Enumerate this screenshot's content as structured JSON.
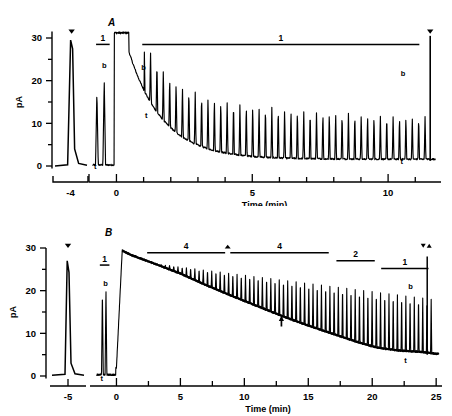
{
  "figure": {
    "type": "electrophysiology-recording",
    "panels": [
      "A",
      "B"
    ]
  },
  "panel_a": {
    "letter": "A",
    "yaxis": {
      "label": "pA",
      "ticks": [
        0,
        10,
        20,
        30
      ],
      "minor_ticks": [
        5,
        15,
        25
      ],
      "range": [
        -2,
        33
      ]
    },
    "xaxis": {
      "label": "Time (min)",
      "ticks": [
        0,
        5,
        10
      ],
      "minor_ticks": [
        1,
        2,
        3,
        4,
        6,
        7,
        8,
        9,
        11
      ],
      "range": [
        -0.9,
        11.8
      ],
      "break_segment": {
        "tick_label": "-4",
        "range": [
          -4.6,
          -3.4
        ]
      }
    },
    "bars": [
      {
        "label": "1",
        "x_start": -0.75,
        "x_end": -0.25,
        "y": 28.5
      },
      {
        "label": "1",
        "x_start": 0.95,
        "x_end": 11.15,
        "y": 28.5
      }
    ],
    "markers": [
      {
        "label": "b",
        "type": "text",
        "x": -0.45,
        "y": 23.0
      },
      {
        "label": "t",
        "type": "text",
        "x": -0.78,
        "y": -0.8
      },
      {
        "label": "b",
        "type": "text",
        "x": 1.0,
        "y": 22.5
      },
      {
        "label": "t",
        "type": "text",
        "x": 1.1,
        "y": 11.2
      },
      {
        "label": "b",
        "type": "text",
        "x": 10.55,
        "y": 21.0
      },
      {
        "label": "t",
        "type": "text",
        "x": 10.5,
        "y": 0.4
      },
      {
        "label": "triangle-down",
        "type": "glyph",
        "x": -3.95,
        "y": 32.0
      },
      {
        "label": "triangle-down",
        "type": "glyph",
        "x": 11.55,
        "y": 32.0
      }
    ],
    "chart_data": {
      "type": "line",
      "title": "A",
      "xlabel": "Time (min)",
      "ylabel": "pA",
      "xlim": [
        -0.9,
        11.8
      ],
      "ylim": [
        -2,
        33
      ],
      "description": "Whole-cell current trace: baseline spikes before 0, a large sustained plateau at ~31 pA from 0 to 0.45 min, then a decaying envelope with regular evoked transient spikes.",
      "baseline_spikes": [
        {
          "x": -3.95,
          "amplitude": 29.5
        },
        {
          "x": -0.72,
          "amplitude": 17.5
        },
        {
          "x": -0.45,
          "amplitude": 20.3
        }
      ],
      "plateau": {
        "x_start": -0.08,
        "x_end": 0.46,
        "amplitude": 31.2
      },
      "decay": {
        "x_start": 0.5,
        "x_end": 11.6,
        "start_value": 26.0,
        "tau": 1.25,
        "asymptote": 1.6
      },
      "spike_train": {
        "x_start": 1.02,
        "interval": 0.235,
        "count": 45,
        "peak_start": 22.0,
        "peak_tau": 3.6,
        "peak_floor": 10.5
      },
      "final_spike": {
        "x": 11.55,
        "amplitude": 30.5
      }
    }
  },
  "panel_b": {
    "letter": "B",
    "yaxis": {
      "label": "pA",
      "ticks": [
        0,
        10,
        20,
        30
      ],
      "minor_ticks": [
        5,
        15,
        25
      ],
      "range": [
        -2,
        32
      ]
    },
    "xaxis": {
      "label": "Time (min)",
      "ticks": [
        0,
        5,
        10,
        15,
        20,
        25
      ],
      "minor_ticks": [
        2.5,
        7.5,
        12.5,
        17.5,
        22.5
      ],
      "range": [
        -1.6,
        25.3
      ],
      "break_segment": {
        "tick_label": "-5",
        "range": [
          -5.8,
          -4.2
        ]
      }
    },
    "bars": [
      {
        "label": "1",
        "x_start": -1.3,
        "x_end": -0.55,
        "y": 26.0
      },
      {
        "label": "4",
        "x_start": 2.4,
        "x_end": 8.5,
        "y": 28.9
      },
      {
        "label": "4",
        "x_start": 8.9,
        "x_end": 16.6,
        "y": 28.9
      },
      {
        "label": "2",
        "x_start": 17.2,
        "x_end": 20.2,
        "y": 27.0
      },
      {
        "label": "1",
        "x_start": 20.7,
        "x_end": 24.4,
        "y": 25.2
      }
    ],
    "markers": [
      {
        "label": "b",
        "type": "text",
        "x": -0.85,
        "y": 21.0
      },
      {
        "label": "t",
        "type": "text",
        "x": -1.15,
        "y": -1.2
      },
      {
        "label": "b",
        "type": "text",
        "x": 23.0,
        "y": 20.5
      },
      {
        "label": "t",
        "type": "text",
        "x": 22.6,
        "y": 3.0
      },
      {
        "label": "arrow-up",
        "type": "glyph",
        "x": 12.9,
        "y": 11.6
      },
      {
        "label": "triangle-down",
        "type": "glyph",
        "x": -5.0,
        "y": 31.0
      },
      {
        "label": "triangle-pair",
        "type": "glyph",
        "x": 24.3,
        "y": 31.0
      },
      {
        "label": "triangle-up-small",
        "type": "glyph",
        "x": 8.7,
        "y": 29.9
      }
    ],
    "chart_data": {
      "type": "line",
      "title": "B",
      "xlabel": "Time (min)",
      "ylabel": "pA",
      "xlim": [
        -1.6,
        25.3
      ],
      "ylim": [
        -2,
        32
      ],
      "description": "Whole-cell current trace: baseline spikes before 0, peak ~29.5 pA just after 0, then a slow near-linear run-down to ~5 pA by 25 min, with a dense train of evoked transient spikes riding on the envelope.",
      "baseline_spikes": [
        {
          "x": -5.0,
          "amplitude": 27.0
        },
        {
          "x": -1.1,
          "amplitude": 19.5
        },
        {
          "x": -0.82,
          "amplitude": 20.3
        }
      ],
      "envelope": [
        {
          "x": 0.0,
          "y": 2.0
        },
        {
          "x": 0.45,
          "y": 29.4
        },
        {
          "x": 1.2,
          "y": 28.3
        },
        {
          "x": 3.0,
          "y": 26.3
        },
        {
          "x": 5.0,
          "y": 24.0
        },
        {
          "x": 7.0,
          "y": 21.3
        },
        {
          "x": 9.0,
          "y": 18.8
        },
        {
          "x": 11.0,
          "y": 16.4
        },
        {
          "x": 13.0,
          "y": 14.0
        },
        {
          "x": 15.0,
          "y": 11.8
        },
        {
          "x": 17.0,
          "y": 9.8
        },
        {
          "x": 19.0,
          "y": 7.8
        },
        {
          "x": 20.5,
          "y": 6.6
        },
        {
          "x": 22.0,
          "y": 6.0
        },
        {
          "x": 24.0,
          "y": 5.6
        },
        {
          "x": 25.0,
          "y": 5.2
        }
      ],
      "spike_train": {
        "x_start": 2.5,
        "interval": 0.33,
        "count": 68,
        "peak_top_start": 26.5,
        "peak_top_end": 18.0
      }
    }
  }
}
